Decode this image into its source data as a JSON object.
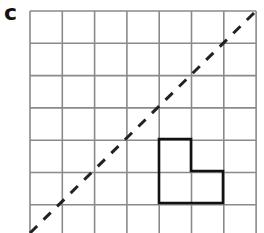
{
  "figure": {
    "label": "c",
    "grid": {
      "columns": 7,
      "rows": 7,
      "origin_x": 30,
      "origin_y": 11,
      "cell_size": 32.3,
      "line_color": "#8a8a8a"
    },
    "diagonal": {
      "style": "dashed",
      "from": [
        30,
        233
      ],
      "to": [
        256,
        11
      ],
      "color": "#222222"
    },
    "shape": {
      "type": "L-shape",
      "points": [
        [
          159,
          139
        ],
        [
          191,
          139
        ],
        [
          191,
          171
        ],
        [
          223,
          171
        ],
        [
          223,
          203
        ],
        [
          159,
          203
        ]
      ],
      "color": "#111111"
    }
  }
}
